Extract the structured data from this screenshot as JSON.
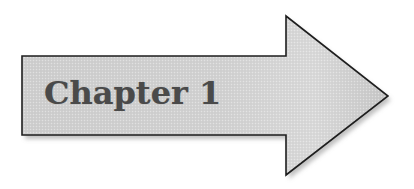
{
  "diagram": {
    "type": "block-arrow",
    "direction": "right",
    "label": "Chapter 1",
    "colors": {
      "fill_light": "#dedede",
      "fill_dark": "#c4c4c4",
      "stroke": "#1e1e1e",
      "text": "#4a4a4a",
      "shadow": "#9a9a9a",
      "background": "#ffffff"
    }
  }
}
